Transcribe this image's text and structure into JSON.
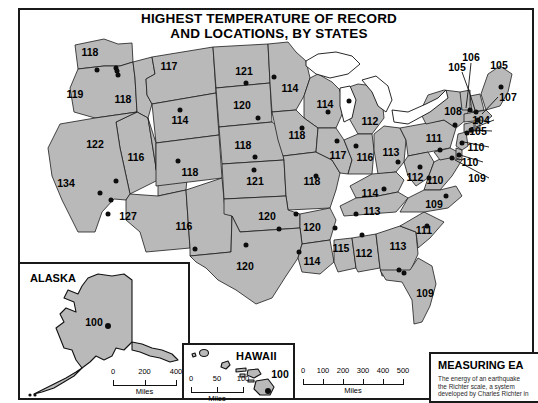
{
  "title": {
    "line1": "HIGHEST TEMPERATURE OF RECORD",
    "line2": "AND LOCATIONS, BY STATES"
  },
  "colors": {
    "land": "#b9b9b9",
    "border": "#1c1c1c",
    "dot": "#0d0d0d",
    "water": "#ffffff",
    "frame": "#1a1a1a"
  },
  "chart_data": {
    "type": "map",
    "title": "HIGHEST TEMPERATURE OF RECORD AND LOCATIONS, BY STATES",
    "unit": "degrees Fahrenheit",
    "states": [
      {
        "name": "Washington",
        "value": "118",
        "lx": 90,
        "ly": 52,
        "dx": 116,
        "dy": 68
      },
      {
        "name": "Oregon",
        "value": "119",
        "lx": 75,
        "ly": 94,
        "dx": 97,
        "dy": 70
      },
      {
        "name": "Idaho",
        "value": "118",
        "lx": 123,
        "ly": 99,
        "dx": 118,
        "dy": 75
      },
      {
        "name": "Montana",
        "value": "117",
        "lx": 169,
        "ly": 66,
        "dx": 117,
        "dy": 71
      },
      {
        "name": "Wyoming",
        "value": "114",
        "lx": 180,
        "ly": 120,
        "dx": 180,
        "dy": 110
      },
      {
        "name": "Nevada",
        "value": "122",
        "lx": 95,
        "ly": 144,
        "dx": 111,
        "dy": 200
      },
      {
        "name": "California",
        "value": "134",
        "lx": 66,
        "ly": 183,
        "dx": 100,
        "dy": 193
      },
      {
        "name": "Utah",
        "value": "116",
        "lx": 136,
        "ly": 157,
        "dx": 116,
        "dy": 181
      },
      {
        "name": "Arizona",
        "value": "127",
        "lx": 128,
        "ly": 216,
        "dx": 108,
        "dy": 214
      },
      {
        "name": "Colorado",
        "value": "118",
        "lx": 190,
        "ly": 172,
        "dx": 178,
        "dy": 161
      },
      {
        "name": "New Mexico",
        "value": "116",
        "lx": 184,
        "ly": 226,
        "dx": 195,
        "dy": 249
      },
      {
        "name": "North Dakota",
        "value": "121",
        "lx": 244,
        "ly": 71,
        "dx": 246,
        "dy": 83
      },
      {
        "name": "South Dakota",
        "value": "120",
        "lx": 242,
        "ly": 105,
        "dx": 258,
        "dy": 118
      },
      {
        "name": "Nebraska",
        "value": "118",
        "lx": 243,
        "ly": 145,
        "dx": 255,
        "dy": 157
      },
      {
        "name": "Kansas",
        "value": "121",
        "lx": 255,
        "ly": 181,
        "dx": 254,
        "dy": 170
      },
      {
        "name": "Minnesota",
        "value": "114",
        "lx": 290,
        "ly": 88,
        "dx": 274,
        "dy": 77
      },
      {
        "name": "Wisconsin",
        "value": "114",
        "lx": 325,
        "ly": 104,
        "dx": 328,
        "dy": 112
      },
      {
        "name": "Iowa",
        "value": "118",
        "lx": 297,
        "ly": 135,
        "dx": 302,
        "dy": 128
      },
      {
        "name": "Missouri",
        "value": "118",
        "lx": 312,
        "ly": 181,
        "dx": 316,
        "dy": 176
      },
      {
        "name": "Illinois",
        "value": "117",
        "lx": 338,
        "ly": 155,
        "dx": 337,
        "dy": 141
      },
      {
        "name": "Michigan",
        "value": "112",
        "lx": 370,
        "ly": 121,
        "dx": 349,
        "dy": 101
      },
      {
        "name": "Indiana",
        "value": "116",
        "lx": 365,
        "ly": 157,
        "dx": 356,
        "dy": 146
      },
      {
        "name": "Ohio",
        "value": "113",
        "lx": 391,
        "ly": 152,
        "dx": 398,
        "dy": 162
      },
      {
        "name": "Kentucky",
        "value": "114",
        "lx": 370,
        "ly": 193,
        "dx": 384,
        "dy": 189
      },
      {
        "name": "Tennessee",
        "value": "113",
        "lx": 372,
        "ly": 211,
        "dx": 356,
        "dy": 214
      },
      {
        "name": "Oklahoma",
        "value": "120",
        "lx": 267,
        "ly": 216,
        "dx": 279,
        "dy": 229
      },
      {
        "name": "Arkansas",
        "value": "120",
        "lx": 312,
        "ly": 227,
        "dx": 296,
        "dy": 214
      },
      {
        "name": "Texas",
        "value": "120",
        "lx": 245,
        "ly": 266,
        "dx": 246,
        "dy": 245
      },
      {
        "name": "Louisiana",
        "value": "114",
        "lx": 312,
        "ly": 261,
        "dx": 299,
        "dy": 252
      },
      {
        "name": "Mississippi",
        "value": "115",
        "lx": 341,
        "ly": 248,
        "dx": 335,
        "dy": 228
      },
      {
        "name": "Alabama",
        "value": "112",
        "lx": 364,
        "ly": 253,
        "dx": 362,
        "dy": 235
      },
      {
        "name": "Georgia",
        "value": "113",
        "lx": 398,
        "ly": 246,
        "dx": 399,
        "dy": 270
      },
      {
        "name": "Florida",
        "value": "109",
        "lx": 425,
        "ly": 293,
        "dx": 404,
        "dy": 273
      },
      {
        "name": "South Carolina",
        "value": "111",
        "lx": 424,
        "ly": 230,
        "dx": 427,
        "dy": 226
      },
      {
        "name": "North Carolina",
        "value": "109",
        "lx": 434,
        "ly": 204,
        "dx": 446,
        "dy": 196
      },
      {
        "name": "Virginia",
        "value": "110",
        "lx": 435,
        "ly": 180,
        "dx": 429,
        "dy": 178
      },
      {
        "name": "West Virginia",
        "value": "112",
        "lx": 415,
        "ly": 177,
        "dx": 420,
        "dy": 167
      },
      {
        "name": "Pennsylvania",
        "value": "111",
        "lx": 434,
        "ly": 138,
        "dx": 440,
        "dy": 150
      },
      {
        "name": "New York",
        "value": "108",
        "lx": 453,
        "ly": 111,
        "dx": 455,
        "dy": 125
      },
      {
        "name": "Maryland",
        "value": "109",
        "lx": 477,
        "ly": 178,
        "dx": 452,
        "dy": 158
      },
      {
        "name": "Delaware",
        "value": "110",
        "lx": 470,
        "ly": 162,
        "dx": 459,
        "dy": 155
      },
      {
        "name": "New Jersey",
        "value": "110",
        "lx": 476,
        "ly": 147,
        "dx": 462,
        "dy": 143
      },
      {
        "name": "Connecticut",
        "value": "105",
        "lx": 478,
        "ly": 131,
        "dx": 467,
        "dy": 133
      },
      {
        "name": "Rhode Island",
        "value": "104",
        "lx": 481,
        "ly": 120,
        "dx": 471,
        "dy": 130
      },
      {
        "name": "Massachusetts",
        "value": "107",
        "lx": 508,
        "ly": 97,
        "dx": 478,
        "dy": 120
      },
      {
        "name": "New Hampshire",
        "value": "105",
        "lx": 457,
        "ly": 67,
        "dx": 476,
        "dy": 112
      },
      {
        "name": "Vermont",
        "value": "106",
        "lx": 471,
        "ly": 57,
        "dx": 470,
        "dy": 110
      },
      {
        "name": "Maine",
        "value": "105",
        "lx": 499,
        "ly": 65,
        "dx": 501,
        "dy": 87
      },
      {
        "name": "Alaska",
        "value": "100",
        "lx": 0,
        "ly": 0,
        "dx": 0,
        "dy": 0
      },
      {
        "name": "Hawaii",
        "value": "100",
        "lx": 0,
        "ly": 0,
        "dx": 0,
        "dy": 0
      }
    ]
  },
  "insets": {
    "alaska": {
      "title": "ALASKA",
      "value": "100"
    },
    "hawaii": {
      "title": "HAWAII",
      "value": "100"
    }
  },
  "scales": {
    "main": {
      "unit": "Miles",
      "ticks": [
        "0",
        "100",
        "200",
        "300",
        "400",
        "500"
      ]
    },
    "alaska": {
      "unit": "Miles",
      "ticks": [
        "0",
        "200",
        "400"
      ]
    },
    "hawaii": {
      "unit": "Miles",
      "ticks": [
        "0",
        "50",
        "100"
      ]
    }
  },
  "earthquake_panel": {
    "title": "MEASURING EA",
    "line1": "The energy of an earthquake",
    "line2": "the Richter scale, a system",
    "line3": "developed by Charles Richter in"
  }
}
